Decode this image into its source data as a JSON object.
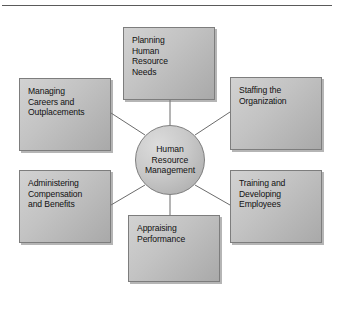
{
  "figure": {
    "type": "hub-and-spoke diagram",
    "background_color": "#ffffff",
    "node_fill_color": "#c3c3c3",
    "node_border_color": "#7d7d7d",
    "connector_color": "#6b6b6b",
    "text_color": "#111111"
  },
  "rule": {
    "present": true
  },
  "hub": {
    "label": "Human Resource Management",
    "lines": [
      "Human",
      "Resource",
      "Management"
    ]
  },
  "nodes": [
    {
      "id": "planning",
      "label": "Planning Human Resource Needs",
      "lines": [
        "Planning",
        "Human",
        "Resource",
        "Needs"
      ],
      "position": "top"
    },
    {
      "id": "staffing",
      "label": "Staffing the Organization",
      "lines": [
        "Staffing the",
        "Organization"
      ],
      "position": "top-right"
    },
    {
      "id": "training",
      "label": "Training and Developing Employees",
      "lines": [
        "Training and",
        "Developing",
        "Employees"
      ],
      "position": "bottom-right"
    },
    {
      "id": "appraising",
      "label": "Appraising Performance",
      "lines": [
        "Appraising",
        "Performance"
      ],
      "position": "bottom"
    },
    {
      "id": "administering",
      "label": "Administering Compensation and Benefits",
      "lines": [
        "Administering",
        "Compensation",
        "and Benefits"
      ],
      "position": "bottom-left"
    },
    {
      "id": "managing",
      "label": "Managing Careers and Outplacements",
      "lines": [
        "Managing",
        "Careers and",
        "Outplacements"
      ],
      "position": "top-left"
    }
  ]
}
